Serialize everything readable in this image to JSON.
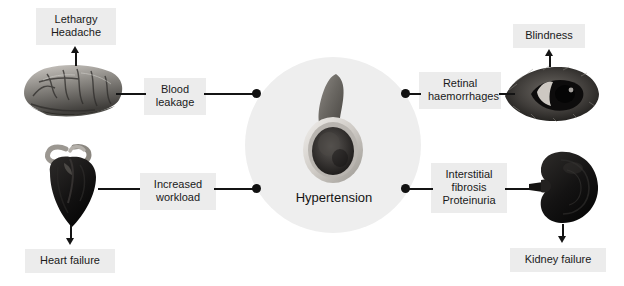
{
  "diagram": {
    "center": {
      "label": "Hypertension",
      "artwork_name": "artery-cross-section-image",
      "halo_color": "#eeeeee"
    },
    "chip_color": "#ececec",
    "line_color": "#141414",
    "branches": [
      {
        "id": "brain",
        "organ_name": "brain-image",
        "mechanism": "Blood\nleakage",
        "outcome": "Lethargy\nHeadache"
      },
      {
        "id": "eye",
        "organ_name": "eye-image",
        "mechanism": "Retinal\nhaemorrhages",
        "outcome": "Blindness"
      },
      {
        "id": "heart",
        "organ_name": "heart-image",
        "mechanism": "Increased\nworkload",
        "outcome": "Heart failure"
      },
      {
        "id": "kidney",
        "organ_name": "kidney-image",
        "mechanism": "Interstitial\nfibrosis\nProteinuria",
        "outcome": "Kidney failure"
      }
    ]
  }
}
